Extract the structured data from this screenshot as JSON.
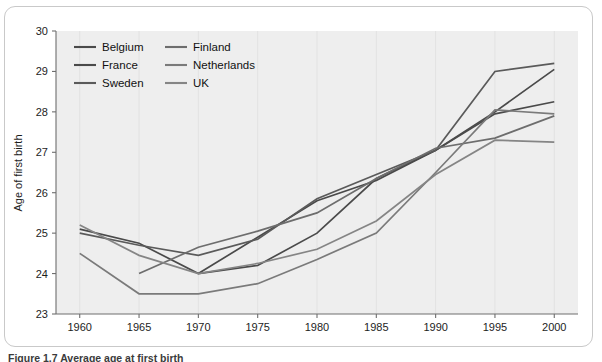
{
  "figure": {
    "caption": "Figure 1.7  Average age at first birth",
    "background_color": "#eeeeee",
    "frame_color": "#c9c9c9"
  },
  "chart_data": {
    "type": "line",
    "title": "",
    "xlabel": "",
    "ylabel": "Age of first birth",
    "xlim": [
      1958,
      2002
    ],
    "ylim": [
      23,
      30
    ],
    "grid": true,
    "legend_position": "top-left",
    "x": [
      1960,
      1965,
      1970,
      1975,
      1980,
      1985,
      1990,
      1995,
      2000
    ],
    "xtick_labels": [
      "1960",
      "1965",
      "1970",
      "1975",
      "1980",
      "1985",
      "1990",
      "1995",
      "2000"
    ],
    "ytick_labels": [
      "23",
      "24",
      "25",
      "26",
      "27",
      "28",
      "29",
      "30"
    ],
    "series": [
      {
        "name": "Belgium",
        "color": "#4a4a4a",
        "values": [
          null,
          null,
          24.0,
          24.9,
          25.8,
          26.3,
          27.05,
          27.95,
          28.25
        ]
      },
      {
        "name": "France",
        "color": "#4a4a4a",
        "values": [
          25.1,
          24.75,
          24.0,
          24.2,
          25.0,
          26.35,
          27.05,
          28.0,
          29.05
        ]
      },
      {
        "name": "Sweden",
        "color": "#5a5a5a",
        "values": [
          25.0,
          24.7,
          24.45,
          24.85,
          25.85,
          26.45,
          27.05,
          29.0,
          29.2
        ]
      },
      {
        "name": "Finland",
        "color": "#6d6d6d",
        "values": [
          null,
          24.0,
          24.65,
          25.05,
          25.5,
          26.35,
          27.1,
          27.35,
          27.9
        ]
      },
      {
        "name": "Netherlands",
        "color": "#7a7a7a",
        "values": [
          24.5,
          23.5,
          23.5,
          23.75,
          24.35,
          25.0,
          26.5,
          28.05,
          27.95
        ]
      },
      {
        "name": "UK",
        "color": "#858585",
        "values": [
          25.2,
          24.45,
          24.0,
          24.25,
          24.6,
          25.3,
          26.45,
          27.3,
          27.25
        ]
      }
    ]
  },
  "legend": {
    "items": [
      {
        "label": "Belgium"
      },
      {
        "label": "Finland"
      },
      {
        "label": "France"
      },
      {
        "label": "Netherlands"
      },
      {
        "label": "Sweden"
      },
      {
        "label": "UK"
      }
    ]
  }
}
